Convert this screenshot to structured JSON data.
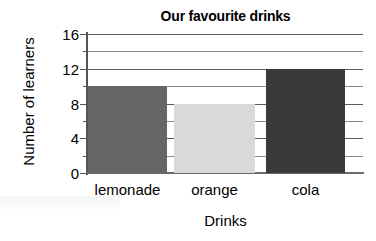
{
  "chart_data": {
    "type": "bar",
    "title": "Our favourite drinks",
    "xlabel": "Drinks",
    "ylabel": "Number of learners",
    "categories": [
      "lemonade",
      "orange",
      "cola"
    ],
    "values": [
      10,
      8,
      12
    ],
    "series": [
      {
        "name": "Number of learners",
        "values": [
          10,
          8,
          12
        ]
      }
    ],
    "bar_colors": [
      "#666666",
      "#d9d9d9",
      "#3a3a3a"
    ],
    "ylim": [
      0,
      16
    ],
    "ytick_labels": [
      "0",
      "4",
      "8",
      "12",
      "16"
    ],
    "ytick_values": [
      0,
      4,
      8,
      12,
      16
    ],
    "minor_tick_values": [
      2,
      6,
      10,
      14
    ],
    "grid": true,
    "grid_axis": "y",
    "legend": false,
    "legend_position": "none"
  },
  "axis": {
    "y_ticks": [
      {
        "label": "16",
        "value": 16
      },
      {
        "label": "14",
        "value": 14
      },
      {
        "label": "12",
        "value": 12
      },
      {
        "label": "10",
        "value": 10
      },
      {
        "label": "8",
        "value": 8
      },
      {
        "label": "6",
        "value": 6
      },
      {
        "label": "4",
        "value": 4
      },
      {
        "label": "2",
        "value": 2
      },
      {
        "label": "0",
        "value": 0
      }
    ]
  },
  "colors": {
    "axis": "#555555",
    "grid": "#6e6e6e",
    "text": "#000000",
    "background": "#ffffff"
  }
}
